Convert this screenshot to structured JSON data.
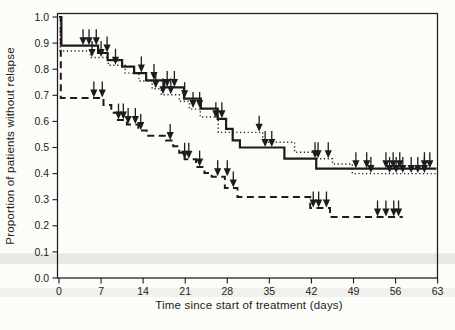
{
  "figure": {
    "kind": "scanned-journal-figure",
    "background_color": "#fcfcf9",
    "ink_color": "#1c1c1c",
    "artifact_band_color": "#e7e7e3",
    "artifact_band_color_faint": "#f0f0ec"
  },
  "chart_data": {
    "type": "line",
    "subtype": "kaplan-meier-step-survival",
    "title": "",
    "xlabel": "Time since start of treatment (days)",
    "ylabel": "Proportion of patients without relapse",
    "xlim": [
      0,
      63
    ],
    "ylim": [
      0.0,
      1.0
    ],
    "xticks": [
      0,
      7,
      14,
      21,
      28,
      35,
      42,
      49,
      56,
      63
    ],
    "yticks": [
      "1.0",
      "0.9",
      "0.8",
      "0.7",
      "0.6",
      "0.5",
      "0.4",
      "0.3",
      "0.2",
      "0.1",
      "0.0"
    ],
    "grid": false,
    "legend": "none",
    "censor_marker": "filled-down-arrow",
    "series": [
      {
        "name": "group-1-solid",
        "line_style": "solid",
        "stroke_width": 2.2,
        "end_day": 62.8,
        "steps": [
          [
            0,
            1.0
          ],
          [
            0.4,
            0.89
          ],
          [
            6.5,
            0.862
          ],
          [
            8.1,
            0.835
          ],
          [
            10.5,
            0.81
          ],
          [
            12.5,
            0.785
          ],
          [
            14.5,
            0.757
          ],
          [
            17.5,
            0.73
          ],
          [
            20.8,
            0.687
          ],
          [
            23.6,
            0.649
          ],
          [
            26.4,
            0.61
          ],
          [
            27.8,
            0.571
          ],
          [
            28.9,
            0.527
          ],
          [
            30.1,
            0.5
          ],
          [
            37.5,
            0.457
          ],
          [
            42.8,
            0.419
          ]
        ],
        "censor_marks": [
          [
            4,
            0.89
          ],
          [
            5,
            0.89
          ],
          [
            6.2,
            0.89
          ],
          [
            8,
            0.862
          ],
          [
            13.7,
            0.785
          ],
          [
            15.8,
            0.757
          ],
          [
            18,
            0.73
          ],
          [
            19.2,
            0.73
          ],
          [
            20.9,
            0.687
          ],
          [
            22.3,
            0.649
          ],
          [
            23.4,
            0.649
          ],
          [
            26.1,
            0.61
          ],
          [
            27.1,
            0.61
          ],
          [
            34.3,
            0.5
          ],
          [
            35.4,
            0.5
          ],
          [
            42.6,
            0.457
          ],
          [
            49.4,
            0.419
          ],
          [
            51.2,
            0.419
          ],
          [
            54.4,
            0.419
          ],
          [
            55.6,
            0.419
          ],
          [
            56.7,
            0.419
          ],
          [
            60.8,
            0.419
          ],
          [
            61.7,
            0.419
          ]
        ]
      },
      {
        "name": "group-2-dotted",
        "line_style": "dotted",
        "stroke_width": 1.4,
        "end_day": 62.8,
        "steps": [
          [
            0,
            1.0
          ],
          [
            0.2,
            0.87
          ],
          [
            5.2,
            0.845
          ],
          [
            8.2,
            0.815
          ],
          [
            11,
            0.785
          ],
          [
            13.3,
            0.755
          ],
          [
            15.5,
            0.725
          ],
          [
            17,
            0.702
          ],
          [
            20,
            0.677
          ],
          [
            21.7,
            0.647
          ],
          [
            23.5,
            0.617
          ],
          [
            26.5,
            0.558
          ],
          [
            33.9,
            0.52
          ],
          [
            39.2,
            0.482
          ],
          [
            42.9,
            0.457
          ],
          [
            45.5,
            0.437
          ],
          [
            48.8,
            0.4
          ]
        ],
        "censor_marks": [
          [
            5.5,
            0.845
          ],
          [
            7,
            0.845
          ],
          [
            9.4,
            0.815
          ],
          [
            16.1,
            0.725
          ],
          [
            17.3,
            0.702
          ],
          [
            18.6,
            0.702
          ],
          [
            33.3,
            0.558
          ],
          [
            43.1,
            0.457
          ],
          [
            44.8,
            0.457
          ],
          [
            51.9,
            0.4
          ],
          [
            55,
            0.4
          ],
          [
            56.1,
            0.4
          ],
          [
            57.2,
            0.4
          ],
          [
            58.6,
            0.4
          ],
          [
            59.7,
            0.4
          ],
          [
            60.8,
            0.4
          ]
        ]
      },
      {
        "name": "group-3-dashed",
        "line_style": "dashed",
        "stroke_width": 2.0,
        "end_day": 57.2,
        "steps": [
          [
            0,
            1.0
          ],
          [
            0.3,
            0.69
          ],
          [
            7.4,
            0.663
          ],
          [
            8.7,
            0.633
          ],
          [
            9.8,
            0.605
          ],
          [
            11.3,
            0.588
          ],
          [
            13.2,
            0.565
          ],
          [
            14.6,
            0.545
          ],
          [
            17.8,
            0.527
          ],
          [
            19,
            0.505
          ],
          [
            20,
            0.48
          ],
          [
            20.9,
            0.455
          ],
          [
            22.8,
            0.425
          ],
          [
            24.2,
            0.402
          ],
          [
            25.4,
            0.388
          ],
          [
            27.6,
            0.345
          ],
          [
            29.7,
            0.31
          ],
          [
            41.8,
            0.268
          ],
          [
            45.1,
            0.234
          ]
        ],
        "censor_marks": [
          [
            5.8,
            0.69
          ],
          [
            7.2,
            0.69
          ],
          [
            9.9,
            0.605
          ],
          [
            10.7,
            0.605
          ],
          [
            11.5,
            0.588
          ],
          [
            12.7,
            0.588
          ],
          [
            13.6,
            0.565
          ],
          [
            18.5,
            0.527
          ],
          [
            20.9,
            0.455
          ],
          [
            21.6,
            0.455
          ],
          [
            23.4,
            0.425
          ],
          [
            26.4,
            0.388
          ],
          [
            28,
            0.388
          ],
          [
            29,
            0.345
          ],
          [
            42.3,
            0.268
          ],
          [
            43.2,
            0.268
          ],
          [
            44.5,
            0.268
          ],
          [
            53,
            0.234
          ],
          [
            54.4,
            0.234
          ],
          [
            55.7,
            0.234
          ],
          [
            56.5,
            0.234
          ]
        ]
      }
    ]
  }
}
